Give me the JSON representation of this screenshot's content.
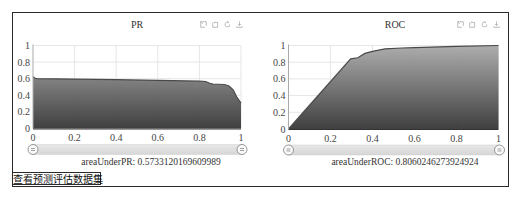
{
  "charts": [
    {
      "id": "pr",
      "title": "PR",
      "footer": "areaUnderPR: 0.5733120169609989"
    },
    {
      "id": "roc",
      "title": "ROC",
      "footer": "areaUnderROC: 0.8060246273924924"
    }
  ],
  "toolbox": {
    "icons": [
      "data-zoom-icon",
      "data-zoom-back-icon",
      "restore-icon",
      "save-as-image-icon"
    ]
  },
  "actions": {
    "view_dataset_button": "查看预测评估数据集"
  },
  "colors": {
    "line": "#4a4a4a",
    "area_top": "#a8a8a8",
    "area_bottom": "#343434",
    "grid": "#e6e6e6",
    "x_axis": "#333333",
    "y_axis": "#aaaaaa",
    "slider": "#d6d6d6",
    "toolbox_icon": "#a0a0a0",
    "border": "#2a2a2a"
  },
  "chart_data": [
    {
      "type": "area",
      "title": "PR",
      "xlabel": "",
      "ylabel": "",
      "xlim": [
        0,
        1
      ],
      "ylim": [
        0,
        1
      ],
      "x_ticks": [
        0,
        0.2,
        0.4,
        0.6,
        0.8,
        1
      ],
      "x_tick_labels": [
        "0",
        "0.2",
        "0.4",
        "0.6",
        "0.8",
        "1"
      ],
      "y_ticks": [
        0,
        0.2,
        0.4,
        0.6,
        0.8,
        1
      ],
      "y_tick_labels": [
        "0",
        "0.2",
        "0.4",
        "0.6",
        "0.8",
        "1"
      ],
      "grid": true,
      "legend": null,
      "zoom_range": [
        0,
        1
      ],
      "annotation": "areaUnderPR: 0.5733120169609989",
      "series": [
        {
          "name": "PR",
          "x": [
            0,
            0.01,
            0.02,
            0.2,
            0.4,
            0.6,
            0.8,
            0.83,
            0.85,
            0.865,
            0.92,
            0.94,
            0.95,
            0.963,
            0.979,
            0.995,
            1.0
          ],
          "y": [
            0.625,
            0.605,
            0.6,
            0.595,
            0.588,
            0.58,
            0.57,
            0.566,
            0.545,
            0.536,
            0.53,
            0.515,
            0.495,
            0.464,
            0.383,
            0.323,
            0.305
          ]
        }
      ]
    },
    {
      "type": "area",
      "title": "ROC",
      "xlabel": "",
      "ylabel": "",
      "xlim": [
        0,
        1
      ],
      "ylim": [
        0,
        1
      ],
      "x_ticks": [
        0,
        0.2,
        0.4,
        0.6,
        0.8,
        1
      ],
      "x_tick_labels": [
        "0",
        "0.2",
        "0.4",
        "0.6",
        "0.8",
        "1"
      ],
      "y_ticks": [
        0,
        0.2,
        0.4,
        0.6,
        0.8,
        1
      ],
      "y_tick_labels": [
        "0",
        "0.2",
        "0.4",
        "0.6",
        "0.8",
        "1"
      ],
      "grid": true,
      "legend": null,
      "zoom_range": [
        0,
        1
      ],
      "annotation": "areaUnderROC: 0.8060246273924924",
      "series": [
        {
          "name": "ROC",
          "x": [
            0,
            0.296,
            0.33,
            0.364,
            0.4,
            0.46,
            0.54,
            0.6,
            0.8,
            1.0
          ],
          "y": [
            0,
            0.84,
            0.853,
            0.905,
            0.93,
            0.96,
            0.97,
            0.975,
            0.99,
            1.0
          ]
        }
      ]
    }
  ]
}
